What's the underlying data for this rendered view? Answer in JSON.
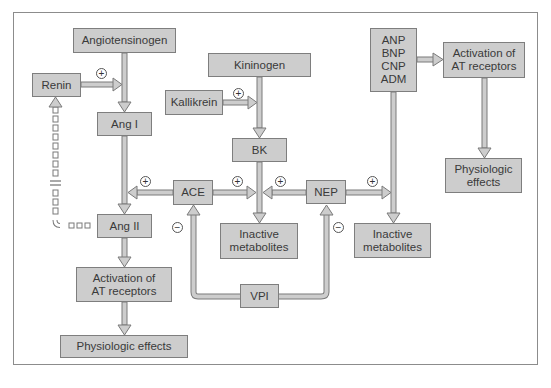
{
  "nodes": {
    "angiotensinogen": "Angiotensinogen",
    "renin": "Renin",
    "ang1": "Ang I",
    "ang2": "Ang II",
    "activation_left": "Activation of\nAT receptors",
    "physiologic_left": "Physiologic effects",
    "kininogen": "Kininogen",
    "kallikrein": "Kallikrein",
    "bk": "BK",
    "ace": "ACE",
    "nep": "NEP",
    "inactive_center": "Inactive\nmetabolites",
    "inactive_right": "Inactive\nmetabolites",
    "vpi": "VPI",
    "natriuretic": "ANP\nBNP\nCNP\nADM",
    "activation_right": "Activation of\nAT receptors",
    "physiologic_right": "Physiologic\neffects"
  },
  "signs": {
    "plus": "+",
    "minus": "−"
  },
  "edges": [
    {
      "from": "angiotensinogen",
      "to": "ang1",
      "type": "arrow"
    },
    {
      "from": "renin",
      "to": "ang1",
      "type": "arrow",
      "sign": "+"
    },
    {
      "from": "ang1",
      "to": "ang2",
      "type": "arrow"
    },
    {
      "from": "ace",
      "to": "ang1-ang2 shaft",
      "type": "arrow",
      "sign": "+"
    },
    {
      "from": "ang2",
      "to": "renin",
      "type": "dashed-feedback-inhibition"
    },
    {
      "from": "ang2",
      "to": "activation_left",
      "type": "arrow"
    },
    {
      "from": "activation_left",
      "to": "physiologic_left",
      "type": "arrow"
    },
    {
      "from": "kininogen",
      "to": "bk",
      "type": "arrow"
    },
    {
      "from": "kallikrein",
      "to": "bk",
      "type": "arrow",
      "sign": "+"
    },
    {
      "from": "bk",
      "to": "inactive_center",
      "type": "arrow"
    },
    {
      "from": "ace",
      "to": "bk shaft",
      "type": "arrow",
      "sign": "+"
    },
    {
      "from": "nep",
      "to": "bk shaft",
      "type": "arrow",
      "sign": "+"
    },
    {
      "from": "nep",
      "to": "natriuretic shaft",
      "type": "arrow",
      "sign": "+"
    },
    {
      "from": "natriuretic",
      "to": "inactive_right",
      "type": "arrow"
    },
    {
      "from": "natriuretic",
      "to": "activation_right",
      "type": "arrow"
    },
    {
      "from": "activation_right",
      "to": "physiologic_right",
      "type": "arrow"
    },
    {
      "from": "vpi",
      "to": "ace",
      "type": "arrow",
      "sign": "-"
    },
    {
      "from": "vpi",
      "to": "nep",
      "type": "arrow",
      "sign": "-"
    }
  ]
}
